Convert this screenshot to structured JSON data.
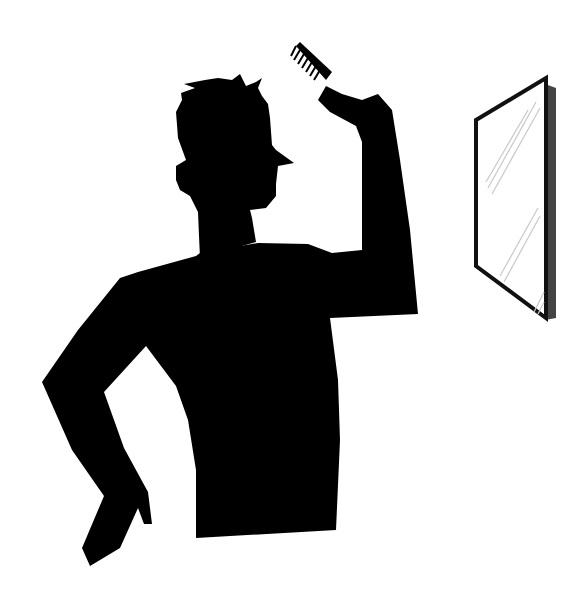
{
  "scene": {
    "description": "Silhouette of a man combing his hair while looking at a wall mirror",
    "background_color": "#ffffff",
    "figure": {
      "label": "man-silhouette",
      "color": "#000000",
      "props": [
        "comb"
      ]
    },
    "mirror": {
      "label": "wall-mirror",
      "frame_color": "#111111",
      "edge_color": "#444444",
      "glass_color": "#ffffff",
      "reflection_color": "#c8c8c8"
    }
  }
}
